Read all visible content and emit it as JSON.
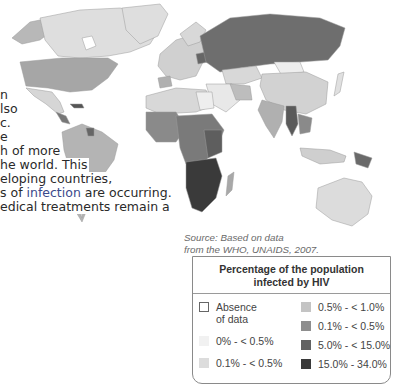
{
  "paragraph": {
    "lines": [
      {
        "text": "n",
        "top": 88
      },
      {
        "text": "lso",
        "top": 102
      },
      {
        "text": "c.",
        "top": 116
      },
      {
        "text": "e",
        "top": 130
      },
      {
        "text": "h of more",
        "top": 144
      },
      {
        "text": "he world. This",
        "top": 158
      },
      {
        "text": "eloping countries,",
        "top": 172
      },
      {
        "pre": "s of ",
        "highlight": "infection",
        "post": " are occurring.",
        "top": 186
      },
      {
        "text": "edical treatments remain a",
        "top": 200
      }
    ]
  },
  "map": {
    "title": "World map of HIV prevalence",
    "source_line1": "Source: Based on data",
    "source_line2": "from the WHO, UNAIDS, 2007."
  },
  "legend": {
    "title_line1": "Percentage of the population",
    "title_line2": "infected by HIV",
    "items": [
      {
        "label": "Absence",
        "label2": "of data",
        "color": "#ffffff",
        "border": "#666666"
      },
      {
        "label": "0% - < 0.5%",
        "color": "#f1f1f1"
      },
      {
        "label": "0.1% - < 0.5%",
        "color": "#dcdcdc"
      },
      {
        "label": "0.5% - < 1.0%",
        "color": "#c4c4c4"
      },
      {
        "label": "0.1% - < 0.5%",
        "color": "#8e8e8e"
      },
      {
        "label": "5.0% - < 15.0%",
        "color": "#626262"
      },
      {
        "label": "15.0% - 34.0%",
        "color": "#3a3a3a"
      }
    ]
  },
  "colors": {
    "highlight_text": "#3b4a8c",
    "no_data": "#ffffff",
    "very_low": "#f1f1f1",
    "low": "#dcdcdc",
    "mid_low": "#c4c4c4",
    "mid": "#8e8e8e",
    "high": "#626262",
    "very_high": "#3a3a3a"
  }
}
